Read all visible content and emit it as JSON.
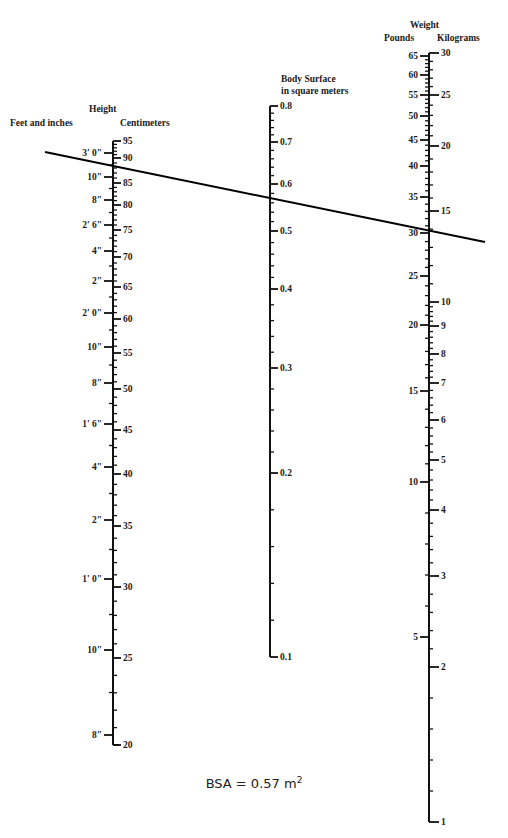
{
  "diagram": {
    "type": "nomogram",
    "height_scale": {
      "title": "Height",
      "left_unit": "Feet and inches",
      "right_unit": "Centimeters",
      "axis_x": 113,
      "cm_labels": [
        {
          "v": "95",
          "y": 141
        },
        {
          "v": "90",
          "y": 158
        },
        {
          "v": "85",
          "y": 183
        },
        {
          "v": "80",
          "y": 205
        },
        {
          "v": "75",
          "y": 230
        },
        {
          "v": "70",
          "y": 257
        },
        {
          "v": "65",
          "y": 287
        },
        {
          "v": "60",
          "y": 319
        },
        {
          "v": "55",
          "y": 353
        },
        {
          "v": "50",
          "y": 389
        },
        {
          "v": "45",
          "y": 430
        },
        {
          "v": "40",
          "y": 474
        },
        {
          "v": "35",
          "y": 526
        },
        {
          "v": "30",
          "y": 587
        },
        {
          "v": "25",
          "y": 658
        },
        {
          "v": "20",
          "y": 745
        }
      ],
      "in_labels": [
        {
          "v": "3' 0\"",
          "y": 153
        },
        {
          "v": "10\"",
          "y": 177
        },
        {
          "v": "8\"",
          "y": 200
        },
        {
          "v": "2' 6\"",
          "y": 225
        },
        {
          "v": "4\"",
          "y": 251
        },
        {
          "v": "2\"",
          "y": 281
        },
        {
          "v": "2' 0\"",
          "y": 313
        },
        {
          "v": "10\"",
          "y": 347
        },
        {
          "v": "8\"",
          "y": 383
        },
        {
          "v": "1' 6\"",
          "y": 424
        },
        {
          "v": "4\"",
          "y": 467
        },
        {
          "v": "2\"",
          "y": 520
        },
        {
          "v": "1' 0\"",
          "y": 579
        },
        {
          "v": "10\"",
          "y": 650
        },
        {
          "v": "8\"",
          "y": 735
        }
      ],
      "range_cm": [
        20,
        95
      ]
    },
    "bsa_scale": {
      "title_line1": "Body Surface",
      "title_line2": "in square meters",
      "axis_x": 270,
      "labels": [
        {
          "v": "0.8",
          "y": 106
        },
        {
          "v": "0.7",
          "y": 142
        },
        {
          "v": "0.6",
          "y": 184
        },
        {
          "v": "0.5",
          "y": 231
        },
        {
          "v": "0.4",
          "y": 289
        },
        {
          "v": "0.3",
          "y": 368
        },
        {
          "v": "0.2",
          "y": 473
        },
        {
          "v": "0.1",
          "y": 657
        }
      ],
      "range_m2": [
        0.1,
        0.8
      ]
    },
    "weight_scale": {
      "title": "Weight",
      "left_unit": "Pounds",
      "right_unit": "Kilograms",
      "axis_x": 429,
      "lb_labels": [
        {
          "v": "65",
          "y": 56
        },
        {
          "v": "60",
          "y": 75
        },
        {
          "v": "55",
          "y": 95
        },
        {
          "v": "50",
          "y": 116
        },
        {
          "v": "45",
          "y": 140
        },
        {
          "v": "40",
          "y": 166
        },
        {
          "v": "35",
          "y": 197
        },
        {
          "v": "30",
          "y": 233
        },
        {
          "v": "25",
          "y": 276
        },
        {
          "v": "20",
          "y": 325
        },
        {
          "v": "15",
          "y": 391
        },
        {
          "v": "10",
          "y": 482
        },
        {
          "v": "5",
          "y": 637
        }
      ],
      "kg_labels": [
        {
          "v": "30",
          "y": 53
        },
        {
          "v": "25",
          "y": 95
        },
        {
          "v": "20",
          "y": 146
        },
        {
          "v": "15",
          "y": 211
        },
        {
          "v": "10",
          "y": 302
        },
        {
          "v": "9",
          "y": 326
        },
        {
          "v": "8",
          "y": 354
        },
        {
          "v": "7",
          "y": 383
        },
        {
          "v": "6",
          "y": 420
        },
        {
          "v": "5",
          "y": 460
        },
        {
          "v": "4",
          "y": 510
        },
        {
          "v": "3",
          "y": 576
        },
        {
          "v": "2",
          "y": 667
        },
        {
          "v": "1",
          "y": 822
        }
      ],
      "range_kg": [
        1,
        30
      ]
    },
    "reading_line": {
      "x1": 45,
      "y1": 152,
      "x2": 485,
      "y2": 242,
      "height_reading_cm": "≈88",
      "bsa_reading_m2": "0.57",
      "weight_reading_kg": "≈14"
    },
    "result": {
      "label": "BSA = 0.57 m",
      "superscript": "2"
    }
  }
}
